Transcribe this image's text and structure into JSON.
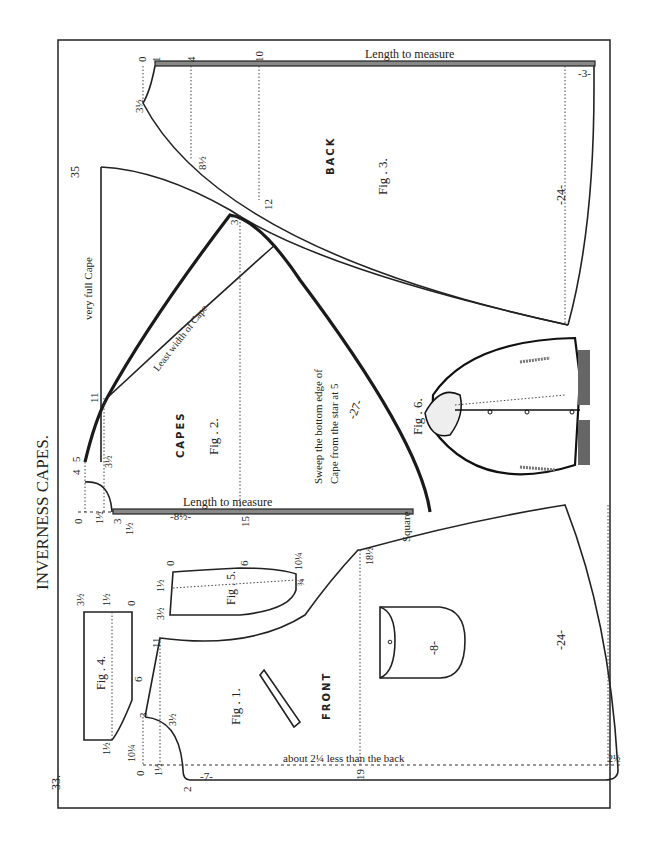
{
  "page": {
    "title": "INVERNESS CAPES.",
    "page_number": "33."
  },
  "figures": {
    "fig1": {
      "label": "Fig . 1.",
      "name": "FRONT",
      "note": "about 2¼ less than the back",
      "marks": [
        "0",
        "1½",
        "3",
        "3½",
        "11",
        "2",
        "-7-",
        "19",
        "18½",
        "-24-",
        "2½",
        "-8-"
      ]
    },
    "fig2": {
      "label": "Fig . 2.",
      "name": "CAPES",
      "very_full": "very full Cape",
      "least_width": "Least width of Cape",
      "sweep_1": "Sweep the bottom edge of",
      "sweep_2": "Cape from the star at 5",
      "length": "Length to measure",
      "square": "Square",
      "marks": [
        "0",
        "1½",
        "3",
        "4",
        "5",
        "3½",
        "11",
        "31",
        "35",
        "-27-",
        "-8½-",
        "15",
        "1½"
      ]
    },
    "fig3": {
      "label": "Fig . 3.",
      "name": "BACK",
      "length": "Length to measure",
      "marks": [
        "0",
        "1",
        "4",
        "10",
        "3½",
        "8½",
        "12",
        "-24-",
        "-3-"
      ]
    },
    "fig4": {
      "label": "Fig . 4.",
      "marks": [
        "3½",
        "1½",
        "0",
        "6",
        "1½",
        "10¼"
      ]
    },
    "fig5": {
      "label": "Fig . 5.",
      "marks": [
        "0",
        "6",
        "10¼",
        "1½",
        "3½",
        "¾"
      ]
    },
    "fig6": {
      "label": "Fig . 6."
    }
  }
}
